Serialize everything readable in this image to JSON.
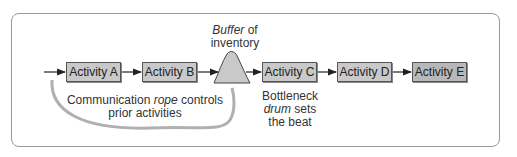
{
  "activities": [
    {
      "label": "Activity A"
    },
    {
      "label": "Activity B"
    },
    {
      "label": "Activity C"
    },
    {
      "label": "Activity D"
    },
    {
      "label": "Activity E"
    }
  ],
  "buffer": {
    "italic": "Buffer",
    "rest": " of",
    "line2": "inventory"
  },
  "rope": {
    "pre": "Communication ",
    "italic": "rope",
    "post": " controls",
    "line2": "prior activities"
  },
  "drum": {
    "line1": "Bottleneck",
    "italic": "drum",
    "post": " sets",
    "line3": "the beat"
  }
}
